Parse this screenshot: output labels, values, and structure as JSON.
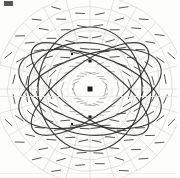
{
  "figure": {
    "background_color": "#fdfdfc",
    "ink_color": "#2e2e2e",
    "grid_color": "#b9b9b9",
    "faint_color": "#d4d2ce",
    "node_color": "#1a1a1a",
    "width": 180,
    "height": 178,
    "center_x": 90,
    "center_y": 89,
    "corner_mark_label": "scan-artifact-mark"
  },
  "chart_data": {
    "type": "scatter",
    "xlabel": "",
    "ylabel": "",
    "grid": true,
    "legend_position": "none",
    "center": [
      90,
      89
    ],
    "polar_grid": {
      "description": "concentric quasi-elliptical rings crossed by radial spokes",
      "ring_radii_x": [
        22,
        34,
        46,
        58,
        70,
        82,
        94
      ],
      "ring_radii_y": [
        22,
        34,
        46,
        58,
        70,
        82,
        94
      ],
      "spoke_count": 24,
      "spoke_angles_deg": [
        0,
        15,
        30,
        45,
        60,
        75,
        90,
        105,
        120,
        135,
        150,
        165,
        180,
        195,
        210,
        225,
        240,
        255,
        270,
        285,
        300,
        315,
        330,
        345
      ]
    },
    "boundary_circles": [
      {
        "rx": 44,
        "ry": 52,
        "color": "#c9c7c3"
      },
      {
        "rx": 34,
        "ry": 40,
        "color": "#d2d0cc"
      }
    ],
    "tick_marks": {
      "description": "short straight direction ticks placed on each grid intersection",
      "ring_radii": [
        16,
        28,
        40,
        52,
        64,
        76,
        88
      ],
      "length": 9,
      "color": "#3a3a3a"
    },
    "ellipses": [
      {
        "name": "ellipse-1",
        "cx": 90,
        "cy": 89,
        "rx": 74,
        "ry": 34,
        "rotation_deg": 18
      },
      {
        "name": "ellipse-2",
        "cx": 90,
        "cy": 89,
        "rx": 74,
        "ry": 34,
        "rotation_deg": -18
      },
      {
        "name": "ellipse-3",
        "cx": 90,
        "cy": 89,
        "rx": 70,
        "ry": 26,
        "rotation_deg": 36
      },
      {
        "name": "ellipse-4",
        "cx": 90,
        "cy": 89,
        "rx": 70,
        "ry": 26,
        "rotation_deg": -36
      },
      {
        "name": "ellipse-5",
        "cx": 90,
        "cy": 89,
        "rx": 52,
        "ry": 62,
        "rotation_deg": 0
      },
      {
        "name": "ellipse-6",
        "cx": 90,
        "cy": 89,
        "rx": 62,
        "ry": 46,
        "rotation_deg": 8
      }
    ],
    "nodes": [
      {
        "name": "node-center",
        "x": 90,
        "y": 89,
        "size": 5
      },
      {
        "name": "node-upper",
        "x": 90,
        "y": 61,
        "size": 3
      },
      {
        "name": "node-lower",
        "x": 90,
        "y": 117,
        "size": 3
      },
      {
        "name": "node-upper-left",
        "x": 72,
        "y": 54,
        "size": 2
      },
      {
        "name": "node-lower-left",
        "x": 72,
        "y": 124,
        "size": 2
      }
    ]
  }
}
